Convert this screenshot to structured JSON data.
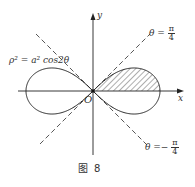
{
  "figure": {
    "caption_prefix": "图",
    "caption_number": "8",
    "curve_label": "ρ² = a² cos2θ",
    "origin_label": "O",
    "x_axis_label": "x",
    "y_axis_label": "y",
    "line_upper": {
      "lhs": "θ =",
      "num": "π",
      "den": "4"
    },
    "line_lower": {
      "lhs": "θ =−",
      "num": "π",
      "den": "4"
    },
    "shaded_region": "first-quadrant half of right lobe (0 ≤ θ ≤ π/4)",
    "colors": {
      "stroke": "#222222",
      "dash": "#444444",
      "text": "#333333"
    }
  }
}
